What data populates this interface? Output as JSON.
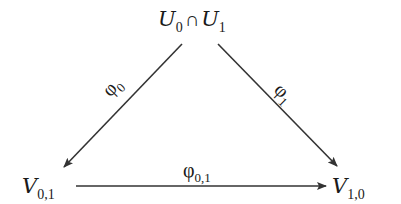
{
  "diagram": {
    "type": "commutative-diagram",
    "nodes": {
      "top": {
        "symbol": "U",
        "sub0": "0",
        "operator": "∩",
        "symbol2": "U",
        "sub1": "1"
      },
      "bottom_left": {
        "symbol": "V",
        "sub": "0,1"
      },
      "bottom_right": {
        "symbol": "V",
        "sub": "1,0"
      }
    },
    "arrows": {
      "left": {
        "symbol": "φ",
        "sub": "0",
        "from": "top",
        "to": "bottom_left"
      },
      "right": {
        "symbol": "φ",
        "sub": "1",
        "from": "top",
        "to": "bottom_right"
      },
      "bottom": {
        "symbol": "φ",
        "sub": "0,1",
        "from": "bottom_left",
        "to": "bottom_right"
      }
    },
    "colors": {
      "stroke": "#333333",
      "text": "#1a1a1a",
      "background": "#ffffff"
    }
  }
}
